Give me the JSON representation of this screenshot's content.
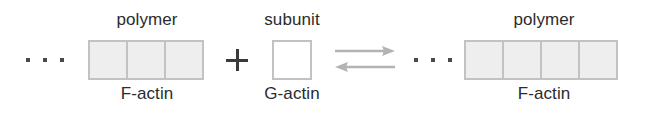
{
  "diagram": {
    "background_color": "#ffffff",
    "text_color": "#2b2b2b",
    "cell_fill_color": "#eeeeee",
    "cell_border_color": "#c2c2c2",
    "arrow_color": "#b3b3b3",
    "plus_color": "#3a3a3a",
    "dot_color": "#4a4a4a"
  },
  "left_group": {
    "top_label": "polymer",
    "bottom_label": "F-actin",
    "ellipsis": "...",
    "subunit_count": 3
  },
  "operator": {
    "plus": "+"
  },
  "middle_group": {
    "top_label": "subunit",
    "bottom_label": "G-actin",
    "subunit_count": 1
  },
  "reaction": {
    "forward_arrow": "right-arrow",
    "reverse_arrow": "left-arrow",
    "symbol": "reversible-equilibrium"
  },
  "right_group": {
    "top_label": "polymer",
    "bottom_label": "F-actin",
    "ellipsis": "...",
    "subunit_count": 4
  }
}
